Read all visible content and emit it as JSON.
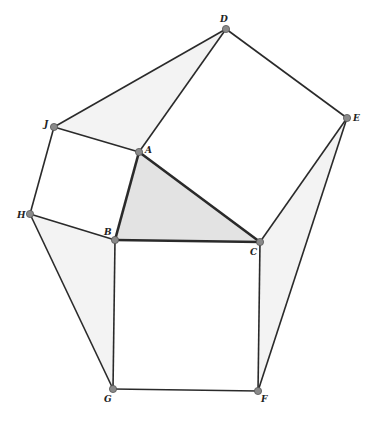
{
  "diagram": {
    "type": "geometry-construction",
    "points": [
      {
        "label": "D",
        "x": 226,
        "y": 29,
        "lx": 220,
        "ly": 22
      },
      {
        "label": "E",
        "x": 347,
        "y": 118,
        "lx": 353,
        "ly": 121
      },
      {
        "label": "J",
        "x": 54,
        "y": 127,
        "lx": 44,
        "ly": 127
      },
      {
        "label": "A",
        "x": 139,
        "y": 152,
        "lx": 145,
        "ly": 153
      },
      {
        "label": "H",
        "x": 30,
        "y": 214,
        "lx": 17,
        "ly": 218
      },
      {
        "label": "B",
        "x": 115,
        "y": 240,
        "lx": 104,
        "ly": 235
      },
      {
        "label": "C",
        "x": 260,
        "y": 242,
        "lx": 250,
        "ly": 255
      },
      {
        "label": "G",
        "x": 113,
        "y": 389,
        "lx": 104,
        "ly": 402
      },
      {
        "label": "F",
        "x": 258,
        "y": 391,
        "lx": 261,
        "ly": 402
      }
    ],
    "colors": {
      "line": "#2a2a2a",
      "point_fill": "#8a8a8a",
      "triangle_fill": "#e3e3e3",
      "shade_fill": "#f3f3f3"
    }
  }
}
